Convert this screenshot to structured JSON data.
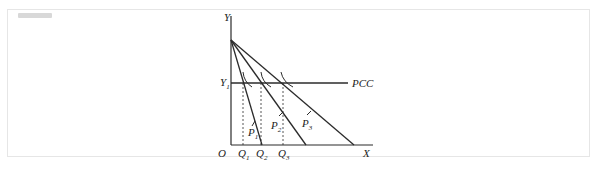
{
  "diagram": {
    "axes": {
      "y_label": "Y",
      "x_label": "X",
      "origin_label": "O"
    },
    "y_level_label": {
      "main": "Y",
      "sub": "1"
    },
    "pcc_label": "PCC",
    "budget_lines": [
      {
        "label": "P",
        "sub": "1"
      },
      {
        "label": "P",
        "sub": "2"
      },
      {
        "label": "P",
        "sub": "3"
      }
    ],
    "quantities": [
      {
        "label": "Q",
        "sub": "1"
      },
      {
        "label": "Q",
        "sub": "2"
      },
      {
        "label": "Q",
        "sub": "3"
      }
    ],
    "colors": {
      "line": "#2b2b2b",
      "frame": "#e6e6e6"
    }
  }
}
